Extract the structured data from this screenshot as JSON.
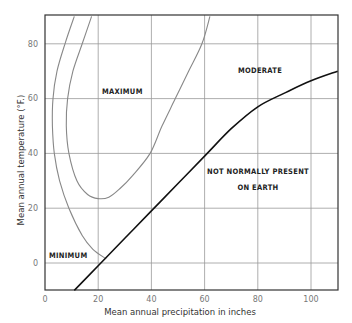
{
  "chart_data": {
    "type": "line",
    "title": "",
    "xlabel": "Mean annual precipitation in inches",
    "ylabel": "Mean annual temperature (°F.)",
    "xlim": [
      0,
      110
    ],
    "ylim": [
      -10,
      90
    ],
    "x_ticks": [
      "0",
      "20",
      "40",
      "60",
      "80",
      "100"
    ],
    "y_ticks": [
      "0",
      "20",
      "40",
      "60",
      "80"
    ],
    "grid": true,
    "series": [
      {
        "name": "Minimum boundary",
        "color": "#888888",
        "points": [
          [
            11,
            90
          ],
          [
            7.5,
            80
          ],
          [
            4.5,
            70
          ],
          [
            3,
            60
          ],
          [
            2.8,
            50
          ],
          [
            3.5,
            40
          ],
          [
            5.5,
            30
          ],
          [
            9,
            20
          ],
          [
            14,
            10
          ],
          [
            18,
            5
          ],
          [
            23,
            1.5
          ]
        ]
      },
      {
        "name": "Maximum boundary",
        "color": "#888888",
        "points": [
          [
            17.5,
            90
          ],
          [
            14,
            80
          ],
          [
            10.5,
            70
          ],
          [
            8.5,
            60
          ],
          [
            8,
            50
          ],
          [
            9,
            40
          ],
          [
            12,
            30
          ],
          [
            16,
            25
          ],
          [
            20,
            23.5
          ],
          [
            24,
            24
          ],
          [
            28,
            27
          ],
          [
            33,
            32
          ],
          [
            39.5,
            40
          ],
          [
            44,
            50
          ],
          [
            49,
            60
          ],
          [
            54,
            70
          ],
          [
            59,
            80
          ],
          [
            62,
            90
          ]
        ]
      },
      {
        "name": "Not normally present boundary",
        "color": "#111111",
        "points": [
          [
            11,
            -10
          ],
          [
            20,
            -1
          ],
          [
            30,
            9
          ],
          [
            40,
            19
          ],
          [
            50,
            29
          ],
          [
            60,
            39
          ],
          [
            70,
            49
          ],
          [
            80,
            57
          ],
          [
            90,
            62
          ],
          [
            100,
            66.5
          ],
          [
            110,
            70
          ]
        ]
      }
    ],
    "annotations": [
      {
        "text": "MAXIMUM",
        "x": 29,
        "y": 63
      },
      {
        "text": "MODERATE",
        "x": 80,
        "y": 66
      },
      {
        "text": "MINIMUM",
        "x": 6,
        "y": 5
      },
      {
        "text": "NOT NORMALLY PRESENT",
        "x": 80,
        "y": 33
      },
      {
        "text": "ON EARTH",
        "x": 80,
        "y": 27
      }
    ]
  },
  "labels": {
    "xlabel": "Mean annual precipitation in inches",
    "ylabel": "Mean annual temperature (°F.)",
    "maximum": "MAXIMUM",
    "moderate": "MODERATE",
    "minimum": "MINIMUM",
    "not_present_1": "NOT NORMALLY PRESENT",
    "not_present_2": "ON EARTH",
    "xt0": "0",
    "xt20": "20",
    "xt40": "40",
    "xt60": "60",
    "xt80": "80",
    "xt100": "100",
    "yt0": "0",
    "yt20": "20",
    "yt40": "40",
    "yt60": "60",
    "yt80": "80"
  }
}
